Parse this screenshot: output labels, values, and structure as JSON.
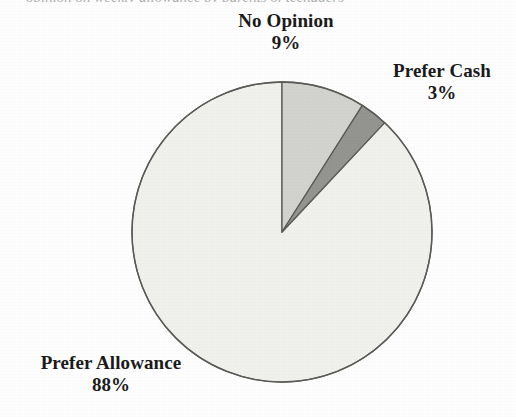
{
  "figure": {
    "background_color": "#fefefe",
    "top_crop_fragment": "opinion on weekly allowance by parents of teenagers",
    "outline_color": "#5a5a56"
  },
  "chart_data": {
    "type": "pie",
    "title": "",
    "categories": [
      "No Opinion",
      "Prefer Cash",
      "Prefer Allowance"
    ],
    "values": [
      9,
      3,
      88
    ],
    "value_labels": [
      "9%",
      "3%",
      "88%"
    ],
    "unit": "%",
    "start_angle_deg": 0,
    "direction": "clockwise",
    "center": {
      "x": 282,
      "y": 232
    },
    "radius": 150,
    "legend": "none",
    "grid": false,
    "slice_colors": [
      "#d2d2ce",
      "#949490",
      "#f0f0ec"
    ],
    "slices": [
      {
        "label": "No Opinion",
        "value": 9,
        "value_label": "9%",
        "color": "#d2d2ce",
        "start_deg": 0,
        "end_deg": 32.4
      },
      {
        "label": "Prefer Cash",
        "value": 3,
        "value_label": "3%",
        "color": "#949490",
        "start_deg": 32.4,
        "end_deg": 43.2
      },
      {
        "label": "Prefer Allowance",
        "value": 88,
        "value_label": "88%",
        "color": "#f0f0ec",
        "start_deg": 43.2,
        "end_deg": 360
      }
    ]
  }
}
